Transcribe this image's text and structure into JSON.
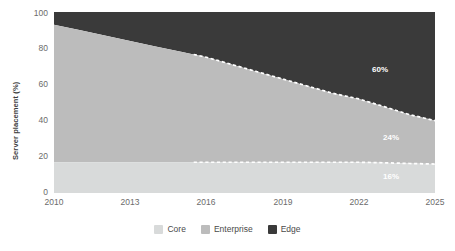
{
  "chart_data": {
    "type": "area",
    "title": "",
    "subtitle": "",
    "xlabel": "",
    "ylabel": "Server placement (%)",
    "stacked": true,
    "stack_total": 100,
    "grid": false,
    "legend_position": "bottom",
    "xlim": [
      2010,
      2025
    ],
    "ylim": [
      0,
      100
    ],
    "x": [
      2010,
      2011,
      2012,
      2013,
      2014,
      2015,
      2016,
      2017,
      2018,
      2019,
      2020,
      2021,
      2022,
      2023,
      2024,
      2025
    ],
    "xticks": [
      "2010",
      "2013",
      "2016",
      "2019",
      "2022",
      "2025"
    ],
    "xtick_values": [
      2010,
      2013,
      2016,
      2019,
      2022,
      2025
    ],
    "yticks": [
      "0",
      "20",
      "40",
      "60",
      "80",
      "100"
    ],
    "ytick_values": [
      0,
      20,
      40,
      60,
      80,
      100
    ],
    "forecast_start": 2015.5,
    "series": [
      {
        "name": "Core",
        "color": "#d8dada",
        "values": [
          17,
          17,
          17,
          17,
          17,
          17,
          17,
          17,
          17,
          17,
          17,
          17,
          17,
          16.7,
          16.3,
          16
        ],
        "end_label": "16%",
        "end_label_color": "#ffffff"
      },
      {
        "name": "Enterprise",
        "color": "#bcbcbc",
        "values": [
          76,
          73,
          70,
          67,
          64,
          61,
          58,
          54,
          50,
          46,
          42,
          38,
          35,
          31,
          27,
          24
        ],
        "end_label": "24%",
        "end_label_color": "#ffffff"
      },
      {
        "name": "Edge",
        "color": "#3a3a3a",
        "values": [
          7,
          10,
          13,
          16,
          19,
          22,
          25,
          29,
          33,
          37,
          41,
          45,
          48,
          52.3,
          56.7,
          60
        ],
        "end_label": "60%",
        "end_label_color": "#ffffff"
      }
    ],
    "cumulative_boundaries": {
      "core_top": [
        17,
        17,
        17,
        17,
        17,
        17,
        17,
        17,
        17,
        17,
        17,
        17,
        17,
        16.7,
        16.3,
        16
      ],
      "enterprise_top": [
        93,
        90,
        87,
        84,
        81,
        78,
        75,
        71,
        67,
        63,
        59,
        55,
        52,
        47.7,
        43.3,
        40
      ]
    }
  },
  "legend": {
    "items": [
      {
        "label": "Core",
        "color": "#d8dada"
      },
      {
        "label": "Enterprise",
        "color": "#bcbcbc"
      },
      {
        "label": "Edge",
        "color": "#3a3a3a"
      }
    ]
  },
  "colors": {
    "core": "#d8dada",
    "enterprise": "#bcbcbc",
    "edge": "#3a3a3a",
    "axis_text": "#6b6b6b",
    "axis_title": "#3d3d3d",
    "forecast_line": "#ffffff",
    "background": "#ffffff"
  }
}
